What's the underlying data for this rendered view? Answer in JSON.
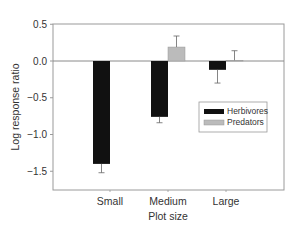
{
  "chart_data": {
    "type": "bar",
    "title": "",
    "xlabel": "Plot size",
    "ylabel": "Log response ratio",
    "categories": [
      "Small",
      "Medium",
      "Large"
    ],
    "series": [
      {
        "name": "Herbivores",
        "color": "#111111",
        "values": [
          -1.4,
          -0.76,
          -0.12
        ],
        "error": [
          0.12,
          0.08,
          0.18
        ],
        "error_direction": "down"
      },
      {
        "name": "Predators",
        "color": "#bbbbbb",
        "values": [
          null,
          0.19,
          0.01
        ],
        "error": [
          null,
          0.15,
          0.13
        ],
        "error_direction": "up"
      }
    ],
    "ylim": [
      -1.75,
      0.5
    ],
    "yticks": [
      0.5,
      0.0,
      -0.5,
      -1.0,
      -1.5
    ],
    "ytick_labels": [
      "0.5",
      "0.0",
      "−0.5",
      "−1.0",
      "−1.5"
    ],
    "grid": false,
    "reference_line": 0.0,
    "legend_position": "center-right, inside plot"
  },
  "legend": {
    "items": [
      {
        "label": "Herbivores",
        "color": "#111111"
      },
      {
        "label": "Predators",
        "color": "#bbbbbb"
      }
    ]
  }
}
